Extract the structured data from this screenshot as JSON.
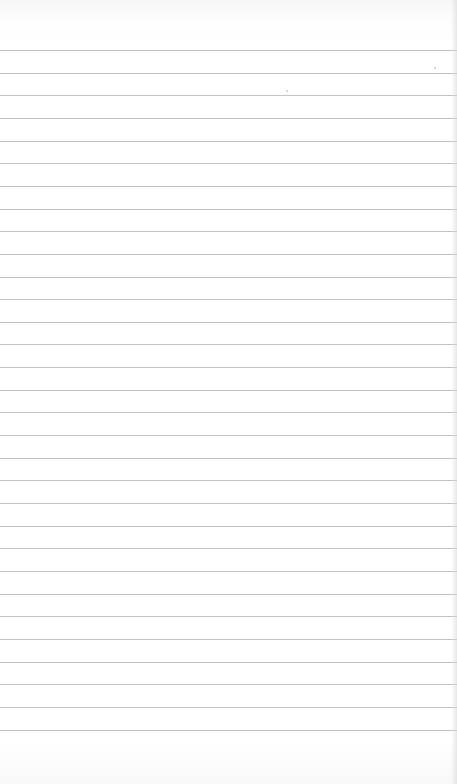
{
  "scene": {
    "description": "Blank sheet of ruled notebook paper",
    "paper_color": "#ffffff",
    "rule_color": "#b9b9b9",
    "rule_count": 31,
    "first_rule_y": 50,
    "rule_spacing_px": 22.65,
    "bleed_through_text": ""
  }
}
